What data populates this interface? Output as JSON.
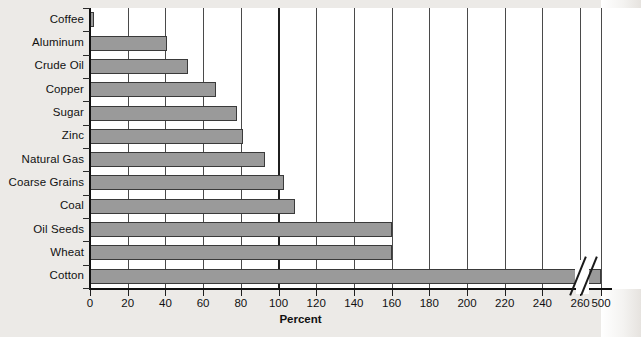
{
  "chart_data": {
    "type": "bar",
    "orientation": "horizontal",
    "title": "",
    "xlabel": "Percent",
    "ylabel": "",
    "categories": [
      "Coffee",
      "Aluminum",
      "Crude Oil",
      "Copper",
      "Sugar",
      "Zinc",
      "Natural Gas",
      "Coarse Grains",
      "Coal",
      "Oil Seeds",
      "Wheat",
      "Cotton"
    ],
    "values": [
      2,
      41,
      52,
      67,
      78,
      81,
      93,
      103,
      109,
      160,
      160,
      500
    ],
    "xlim": [
      0,
      280
    ],
    "xticks": [
      0,
      20,
      40,
      60,
      80,
      100,
      120,
      140,
      160,
      180,
      200,
      220,
      240,
      260,
      500
    ],
    "xtick_labels": [
      "0",
      "20",
      "40",
      "60",
      "80",
      "100",
      "120",
      "140",
      "160",
      "180",
      "200",
      "220",
      "240",
      "260",
      "500"
    ],
    "grid": "vertical",
    "axis_break": {
      "present": true,
      "after_tick": "260",
      "before_tick": "500"
    },
    "legend": "none",
    "bar_color": "#9a9a9a",
    "bar_edge_color": "#3a3a3a",
    "grid_color": "#4a4a4a",
    "axis_color": "#111111",
    "panel_color": "#ffffff",
    "page_color": "#eceae7"
  }
}
